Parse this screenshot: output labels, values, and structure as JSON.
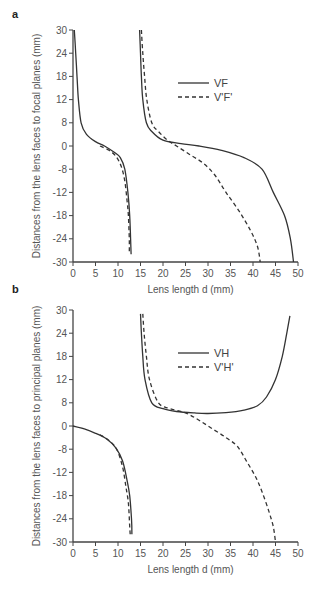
{
  "chart_data": [
    {
      "panel": "a",
      "type": "line",
      "title": "",
      "xlabel": "Lens length d (mm)",
      "ylabel": "Distances from the lens faces to focal planes (mm)",
      "xlim": [
        0,
        50
      ],
      "ylim": [
        -30,
        30
      ],
      "x_ticks": [
        0,
        5,
        10,
        15,
        20,
        25,
        30,
        35,
        40,
        45,
        50
      ],
      "y_ticks": [
        30,
        24,
        18,
        12,
        8,
        0,
        -8,
        -12,
        -18,
        -24,
        -30
      ],
      "grid": false,
      "legend_position": "upper-right-inside",
      "series": [
        {
          "name": "VF",
          "style": "solid",
          "branches": [
            [
              [
                0.3,
                30
              ],
              [
                0.6,
                24
              ],
              [
                0.9,
                18
              ],
              [
                1.2,
                12
              ],
              [
                1.8,
                8
              ],
              [
                3,
                4
              ],
              [
                5,
                1.5
              ],
              [
                7,
                0
              ],
              [
                9,
                -2
              ],
              [
                10.5,
                -4
              ],
              [
                11.5,
                -8
              ],
              [
                12.2,
                -12
              ],
              [
                12.6,
                -18
              ],
              [
                12.8,
                -24
              ],
              [
                12.9,
                -28
              ]
            ],
            [
              [
                14.8,
                30
              ],
              [
                15,
                24
              ],
              [
                15.2,
                18
              ],
              [
                15.5,
                12
              ],
              [
                16.3,
                8
              ],
              [
                17.5,
                5
              ],
              [
                20,
                2
              ],
              [
                24,
                0.8
              ],
              [
                28,
                0
              ],
              [
                33,
                -1.5
              ],
              [
                38,
                -4
              ],
              [
                42,
                -8
              ],
              [
                44.5,
                -12
              ],
              [
                47,
                -18
              ],
              [
                48.3,
                -24
              ],
              [
                49,
                -30
              ]
            ]
          ]
        },
        {
          "name": "V'F'",
          "style": "dashed",
          "branches": [
            [
              [
                6,
                0
              ],
              [
                8,
                -1.5
              ],
              [
                9.5,
                -3.5
              ],
              [
                10.7,
                -7
              ],
              [
                11.5,
                -10
              ],
              [
                12,
                -14
              ],
              [
                12.3,
                -18
              ],
              [
                12.5,
                -24
              ],
              [
                12.5,
                -28
              ]
            ],
            [
              [
                15.2,
                30
              ],
              [
                15.5,
                24
              ],
              [
                15.9,
                18
              ],
              [
                16.4,
                12
              ],
              [
                17.5,
                8
              ],
              [
                19,
                5
              ],
              [
                21,
                2
              ],
              [
                23,
                0
              ],
              [
                26,
                -3
              ],
              [
                29,
                -6
              ],
              [
                31.5,
                -9
              ],
              [
                34,
                -12
              ],
              [
                37,
                -17
              ],
              [
                39.5,
                -22
              ],
              [
                41,
                -26
              ],
              [
                41.6,
                -30
              ]
            ]
          ]
        }
      ]
    },
    {
      "panel": "b",
      "type": "line",
      "title": "",
      "xlabel": "Lens length d (mm)",
      "ylabel": "Distances from the lens faces to principal planes (mm)",
      "xlim": [
        0,
        50
      ],
      "ylim": [
        -30,
        30
      ],
      "x_ticks": [
        0,
        5,
        10,
        15,
        20,
        25,
        30,
        35,
        40,
        45,
        50
      ],
      "y_ticks": [
        30,
        24,
        18,
        12,
        8,
        0,
        -8,
        -12,
        -18,
        -24,
        -30
      ],
      "grid": false,
      "legend_position": "upper-right-inside",
      "series": [
        {
          "name": "VH",
          "style": "solid",
          "branches": [
            [
              [
                0,
                0
              ],
              [
                2.5,
                -1
              ],
              [
                5,
                -2.5
              ],
              [
                7.5,
                -4.5
              ],
              [
                9.5,
                -7.5
              ],
              [
                11,
                -10
              ],
              [
                12,
                -14
              ],
              [
                12.6,
                -18
              ],
              [
                13,
                -24
              ],
              [
                13.1,
                -28
              ]
            ],
            [
              [
                15,
                29
              ],
              [
                15.2,
                24
              ],
              [
                15.5,
                18
              ],
              [
                16,
                12
              ],
              [
                17.5,
                8
              ],
              [
                20,
                6
              ],
              [
                23,
                5
              ],
              [
                27,
                4.5
              ],
              [
                30,
                4.3
              ],
              [
                34,
                4.6
              ],
              [
                38,
                5.5
              ],
              [
                41,
                7
              ],
              [
                43,
                9
              ],
              [
                45,
                12
              ],
              [
                46.5,
                18
              ],
              [
                47.5,
                24
              ],
              [
                48.2,
                28.5
              ]
            ]
          ]
        },
        {
          "name": "V'H'",
          "style": "dashed",
          "branches": [
            [
              [
                6,
                -3
              ],
              [
                8,
                -5
              ],
              [
                9.7,
                -8
              ],
              [
                11,
                -11
              ],
              [
                11.8,
                -16
              ],
              [
                12.3,
                -20
              ],
              [
                12.6,
                -26
              ],
              [
                12.7,
                -28
              ]
            ],
            [
              [
                15.5,
                29
              ],
              [
                15.8,
                24
              ],
              [
                16.3,
                18
              ],
              [
                17,
                12
              ],
              [
                19,
                8
              ],
              [
                21.5,
                6
              ],
              [
                25,
                4.5
              ],
              [
                28,
                2
              ],
              [
                31,
                -1
              ],
              [
                34,
                -4
              ],
              [
                36.5,
                -7
              ],
              [
                38.5,
                -10
              ],
              [
                40.5,
                -13
              ],
              [
                42,
                -17
              ],
              [
                43.5,
                -22
              ],
              [
                44.5,
                -26
              ],
              [
                45,
                -30
              ]
            ]
          ]
        }
      ]
    }
  ],
  "panels": [
    {
      "label": "a",
      "ylabel": "Distances from the lens faces to focal planes (mm)",
      "xlabel": "Lens length d (mm)",
      "legend": [
        {
          "name": "VF",
          "style": "solid"
        },
        {
          "name": "V'F'",
          "style": "dashed"
        }
      ]
    },
    {
      "label": "b",
      "ylabel": "Distances from the lens faces to principal planes (mm)",
      "xlabel": "Lens length d (mm)",
      "legend": [
        {
          "name": "VH",
          "style": "solid"
        },
        {
          "name": "V'H'",
          "style": "dashed"
        }
      ]
    }
  ],
  "colors": {
    "line": "#333333",
    "axis": "#444444",
    "text": "#555555",
    "background": "#ffffff"
  }
}
